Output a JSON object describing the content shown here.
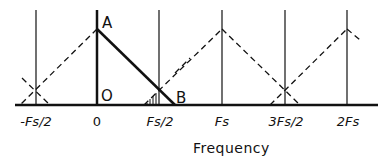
{
  "diagram": {
    "type": "spectrum-aliasing",
    "x_axis_label": "Frequency",
    "tick_labels": [
      {
        "id": "neg_half_fs",
        "text": "-Fs/2",
        "x": 36
      },
      {
        "id": "zero",
        "text": "0",
        "x": 97
      },
      {
        "id": "half_fs",
        "text": "Fs/2",
        "x": 159
      },
      {
        "id": "fs",
        "text": "Fs",
        "x": 222
      },
      {
        "id": "three_half_fs",
        "text": "3Fs/2",
        "x": 285
      },
      {
        "id": "two_fs",
        "text": "2Fs",
        "x": 347
      }
    ],
    "points": {
      "A": "A",
      "O": "O",
      "B": "B"
    },
    "line_color": "#111111",
    "series": [
      {
        "name": "baseband spectrum",
        "style": "solid",
        "peak_at": "0",
        "extends_to": "B"
      },
      {
        "name": "image spectra",
        "style": "dashed",
        "peaks_at": [
          "-Fs",
          "Fs",
          "2Fs"
        ]
      }
    ],
    "annotations": [
      "hatched aliasing region near Fs/2"
    ]
  }
}
